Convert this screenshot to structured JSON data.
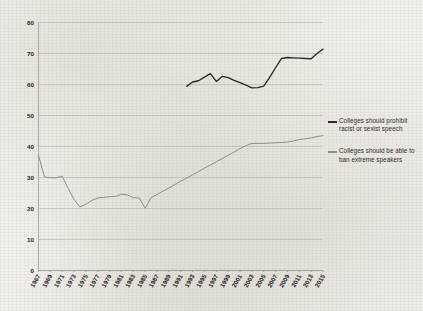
{
  "chart_data": {
    "type": "line",
    "title": "",
    "xlabel": "",
    "ylabel": "",
    "ylim": [
      0,
      80
    ],
    "ytick_values": [
      0,
      10,
      20,
      30,
      40,
      50,
      60,
      70,
      80
    ],
    "grid": true,
    "legend_position": "right",
    "xlim": [
      1967,
      2015
    ],
    "categories": [
      1967,
      1968,
      1969,
      1970,
      1971,
      1972,
      1973,
      1974,
      1975,
      1976,
      1977,
      1978,
      1979,
      1980,
      1981,
      1982,
      1983,
      1984,
      1985,
      1986,
      1987,
      1988,
      1989,
      1990,
      1991,
      1992,
      1993,
      1994,
      1995,
      1996,
      1997,
      1998,
      1999,
      2000,
      2001,
      2002,
      2003,
      2004,
      2005,
      2006,
      2007,
      2008,
      2009,
      2010,
      2011,
      2012,
      2013,
      2014,
      2015
    ],
    "xtick_labels": [
      "1967",
      "1969",
      "1971",
      "1973",
      "1975",
      "1977",
      "1979",
      "1981",
      "1983",
      "1985",
      "1987",
      "1989",
      "1991",
      "1993",
      "1995",
      "1997",
      "1999",
      "2001",
      "2003",
      "2005",
      "2007",
      "2009",
      "2011",
      "2013",
      "2015"
    ],
    "series": [
      {
        "name": "Colleges should prohibit racist or sexist speech",
        "color": "#2a2a2a",
        "x": [
          1992,
          1993,
          1994,
          1995,
          1996,
          1997,
          1998,
          1999,
          2000,
          2001,
          2002,
          2003,
          2004,
          2005,
          2006,
          2007,
          2008,
          2009,
          2010,
          2011,
          2012,
          2013,
          2014,
          2015
        ],
        "values": [
          59.4,
          60.8,
          61.2,
          62.4,
          63.5,
          61.0,
          62.6,
          62.2,
          61.3,
          60.6,
          59.8,
          58.9,
          59.0,
          59.5,
          62.3,
          65.4,
          68.4,
          68.7,
          68.6,
          68.5,
          68.4,
          68.3,
          70.0,
          71.4
        ]
      },
      {
        "name": "Colleges should be able to ban extreme speakers",
        "color": "#8e8d88",
        "x": [
          1967,
          1968,
          1969,
          1970,
          1971,
          1972,
          1973,
          1974,
          1975,
          1976,
          1977,
          1978,
          1979,
          1980,
          1981,
          1982,
          1983,
          1984,
          1985,
          1986,
          1987,
          1988,
          1989,
          1990,
          1991,
          1992,
          1993,
          1994,
          1995,
          1996,
          1997,
          1998,
          1999,
          2000,
          2001,
          2002,
          2003,
          2004,
          2005,
          2006,
          2007,
          2008,
          2009,
          2010,
          2011,
          2012,
          2013,
          2014,
          2015
        ],
        "values": [
          37.2,
          30.2,
          29.9,
          29.9,
          30.4,
          26.5,
          22.9,
          20.5,
          21.4,
          22.6,
          23.4,
          23.6,
          23.8,
          23.9,
          24.6,
          24.4,
          23.5,
          23.4,
          20.1,
          23.5,
          24.5,
          25.6,
          26.6,
          27.7,
          28.8,
          29.8,
          30.9,
          31.9,
          33.0,
          34.0,
          35.1,
          36.1,
          37.2,
          38.2,
          39.3,
          40.3,
          41.0,
          41.0,
          41.0,
          41.1,
          41.2,
          41.3,
          41.4,
          41.8,
          42.2,
          42.5,
          42.8,
          43.2,
          43.5
        ]
      }
    ]
  },
  "legend": {
    "entries": [
      {
        "label": "Colleges should prohibit racist or sexist speech",
        "color": "#2a2a2a"
      },
      {
        "label": "Colleges should be able to ban extreme speakers",
        "color": "#8e8d88"
      }
    ]
  }
}
